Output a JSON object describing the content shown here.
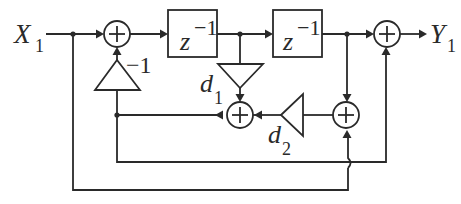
{
  "diagram": {
    "type": "signal-flow",
    "input_label": {
      "main": "X",
      "sub": "1"
    },
    "output_label": {
      "main": "Y",
      "sub": "1"
    },
    "delays": [
      {
        "id": "delay-1",
        "label": {
          "main": "z",
          "sup": "−1"
        }
      },
      {
        "id": "delay-2",
        "label": {
          "main": "z",
          "sup": "−1"
        }
      }
    ],
    "gains": [
      {
        "id": "gain-neg1",
        "label": "−1"
      },
      {
        "id": "gain-d1",
        "label": {
          "main": "d",
          "sub": "1"
        }
      },
      {
        "id": "gain-d2",
        "label": {
          "main": "d",
          "sub": "2"
        }
      }
    ],
    "adders": [
      {
        "id": "adder-input",
        "symbol": "+"
      },
      {
        "id": "adder-d1",
        "symbol": "+"
      },
      {
        "id": "adder-mid",
        "symbol": "+"
      },
      {
        "id": "adder-output",
        "symbol": "+"
      }
    ],
    "colors": {
      "stroke": "#2a2a2a",
      "background": "#ffffff"
    }
  }
}
